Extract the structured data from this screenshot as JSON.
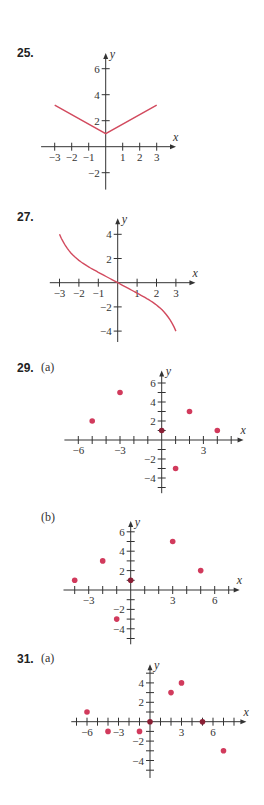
{
  "colors": {
    "curve": "#d24a5e",
    "dot": "#d13a5c",
    "dot_on_axis": "#8a1f35",
    "axis": "#333333"
  },
  "labels": {
    "p25": "25.",
    "p27": "27.",
    "p29": "29.",
    "p29a": "(a)",
    "p29b": "(b)",
    "p31": "31.",
    "p31a": "(a)"
  },
  "chart_data": [
    {
      "id": "25",
      "type": "line",
      "title": "25.",
      "xlabel": "x",
      "ylabel": "y",
      "xticks": [
        -3,
        -2,
        -1,
        1,
        2,
        3
      ],
      "yticks": [
        6,
        4,
        2,
        -2
      ],
      "xlim": [
        -3.5,
        4
      ],
      "ylim": [
        -3,
        7
      ],
      "series": [
        {
          "name": "V-shaped graph",
          "x": [
            -3,
            0,
            3
          ],
          "y": [
            3.2,
            1,
            3.2
          ]
        }
      ],
      "grid": false
    },
    {
      "id": "27",
      "type": "line",
      "title": "27.",
      "xlabel": "x",
      "ylabel": "y",
      "xticks": [
        -3,
        -2,
        -1,
        1,
        2,
        3
      ],
      "yticks": [
        4,
        2,
        -2,
        -4
      ],
      "xlim": [
        -3.5,
        4
      ],
      "ylim": [
        -5,
        5
      ],
      "series": [
        {
          "name": "decreasing curve",
          "x": [
            -3,
            -2,
            -1,
            0,
            1,
            2,
            3
          ],
          "y": [
            4,
            2.2,
            1.0,
            0,
            -1.0,
            -2.2,
            -4
          ]
        }
      ],
      "grid": false
    },
    {
      "id": "29a",
      "type": "scatter",
      "title": "29. (a)",
      "xlabel": "x",
      "ylabel": "y",
      "xticks": [
        -6,
        -3,
        3
      ],
      "yticks": [
        6,
        4,
        2,
        -2,
        -4
      ],
      "xlim": [
        -7,
        6
      ],
      "ylim": [
        -5,
        7
      ],
      "points": [
        [
          -5,
          2
        ],
        [
          -3,
          5
        ],
        [
          0,
          1
        ],
        [
          1,
          -3
        ],
        [
          2,
          3
        ],
        [
          4,
          1
        ]
      ],
      "grid": false
    },
    {
      "id": "29b",
      "type": "scatter",
      "title": "(b)",
      "xlabel": "x",
      "ylabel": "y",
      "xticks": [
        -3,
        3,
        6
      ],
      "yticks": [
        6,
        4,
        2,
        -2,
        -4
      ],
      "xlim": [
        -5,
        8
      ],
      "ylim": [
        -5,
        7
      ],
      "points": [
        [
          -4,
          1
        ],
        [
          -2,
          3
        ],
        [
          -1,
          -3
        ],
        [
          0,
          1
        ],
        [
          3,
          5
        ],
        [
          5,
          2
        ]
      ],
      "grid": false
    },
    {
      "id": "31a",
      "type": "scatter",
      "title": "31. (a)",
      "xlabel": "x",
      "ylabel": "y",
      "xticks": [
        -6,
        -3,
        3,
        6
      ],
      "yticks": [
        4,
        2,
        -2,
        -4
      ],
      "xlim": [
        -8,
        9
      ],
      "ylim": [
        -6,
        6
      ],
      "points": [
        [
          -6,
          1
        ],
        [
          -4,
          -1
        ],
        [
          -1,
          -1
        ],
        [
          0,
          0
        ],
        [
          2,
          3
        ],
        [
          3,
          4
        ],
        [
          5,
          0
        ],
        [
          7,
          -3
        ]
      ],
      "grid": false
    }
  ]
}
